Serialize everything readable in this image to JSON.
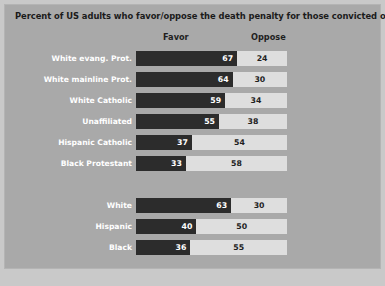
{
  "chart_data": {
    "type": "bar",
    "title": "Percent of US adults who favor/oppose the death penalty for those convicted of murder",
    "xlabel": "",
    "ylabel": "",
    "xlim": [
      0,
      100
    ],
    "grid": false,
    "legend_position": "top",
    "orientation": "horizontal",
    "stacked": true,
    "columns": [
      "Favor",
      "Oppose"
    ],
    "groups": [
      {
        "name": "religion",
        "categories": [
          "White evang. Prot.",
          "White mainline Prot.",
          "White Catholic",
          "Unaffiliated",
          "Hispanic Catholic",
          "Black Protestant"
        ],
        "favor": [
          67,
          64,
          59,
          55,
          37,
          33
        ],
        "oppose": [
          24,
          30,
          34,
          38,
          54,
          58
        ]
      },
      {
        "name": "race",
        "categories": [
          "White",
          "Hispanic",
          "Black"
        ],
        "favor": [
          63,
          40,
          36
        ],
        "oppose": [
          30,
          50,
          55
        ]
      }
    ],
    "series": [
      {
        "name": "Favor",
        "values": [
          67,
          64,
          59,
          55,
          37,
          33,
          63,
          40,
          36
        ]
      },
      {
        "name": "Oppose",
        "values": [
          24,
          30,
          34,
          38,
          54,
          58,
          30,
          50,
          55
        ]
      }
    ],
    "categories": [
      "White evang. Prot.",
      "White mainline Prot.",
      "White Catholic",
      "Unaffiliated",
      "Hispanic Catholic",
      "Black Protestant",
      "White",
      "Hispanic",
      "Black"
    ],
    "colors": {
      "panel_background": "#a9a9a9",
      "page_background": "#c9c9c9",
      "favor_bar": "#2c2c2c",
      "oppose_track": "#dedede",
      "label_text": "#ffffff",
      "title_text": "#1b1b1b"
    }
  },
  "header": {
    "title": "Percent of US adults who favor/oppose the death penalty for those convicted of murder",
    "favor_label": "Favor",
    "oppose_label": "Oppose"
  }
}
